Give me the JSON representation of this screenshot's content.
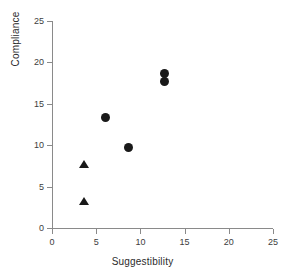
{
  "chart_data": {
    "type": "scatter",
    "title": "",
    "xlabel": "Suggestibility",
    "ylabel": "Compliance",
    "xlim": [
      0,
      25
    ],
    "ylim": [
      0,
      25
    ],
    "xticks": [
      "0",
      "5",
      "10",
      "15",
      "20",
      "25"
    ],
    "yticks": [
      "0",
      "5",
      "10",
      "15",
      "20",
      "25"
    ],
    "grid": false,
    "legend": "none",
    "axis_color": "#8a8a8a",
    "marker_color": "#191919",
    "series": [
      {
        "name": "triangle-group",
        "marker": "triangle",
        "points": [
          {
            "x": 3.6,
            "y": 7.7
          },
          {
            "x": 3.6,
            "y": 3.3
          }
        ]
      },
      {
        "name": "circle-group",
        "marker": "circle",
        "points": [
          {
            "x": 6.1,
            "y": 13.4
          },
          {
            "x": 8.6,
            "y": 9.7
          },
          {
            "x": 12.7,
            "y": 18.6
          },
          {
            "x": 12.7,
            "y": 17.7
          }
        ]
      }
    ]
  }
}
